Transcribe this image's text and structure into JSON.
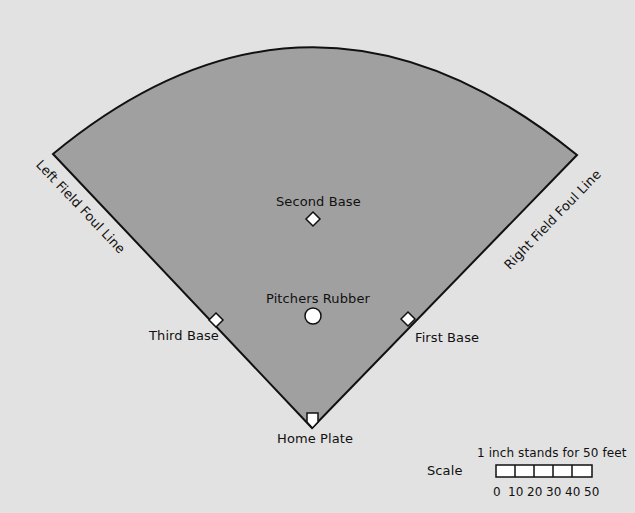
{
  "diagram": {
    "colors": {
      "background": "#e2e2e2",
      "field_fill": "#a0a0a0",
      "outline": "#111111",
      "base_fill": "#ffffff"
    },
    "labels": {
      "left_foul_line": "Left Field Foul Line",
      "right_foul_line": "Right Field Foul Line",
      "second_base": "Second Base",
      "pitchers_rubber": "Pitchers Rubber",
      "third_base": "Third Base",
      "first_base": "First Base",
      "home_plate": "Home Plate"
    },
    "scale": {
      "label": "Scale",
      "caption": "1 inch stands for 50 feet",
      "ticks": [
        "0",
        "10",
        "20",
        "30",
        "40",
        "50"
      ],
      "segments": 5
    }
  }
}
